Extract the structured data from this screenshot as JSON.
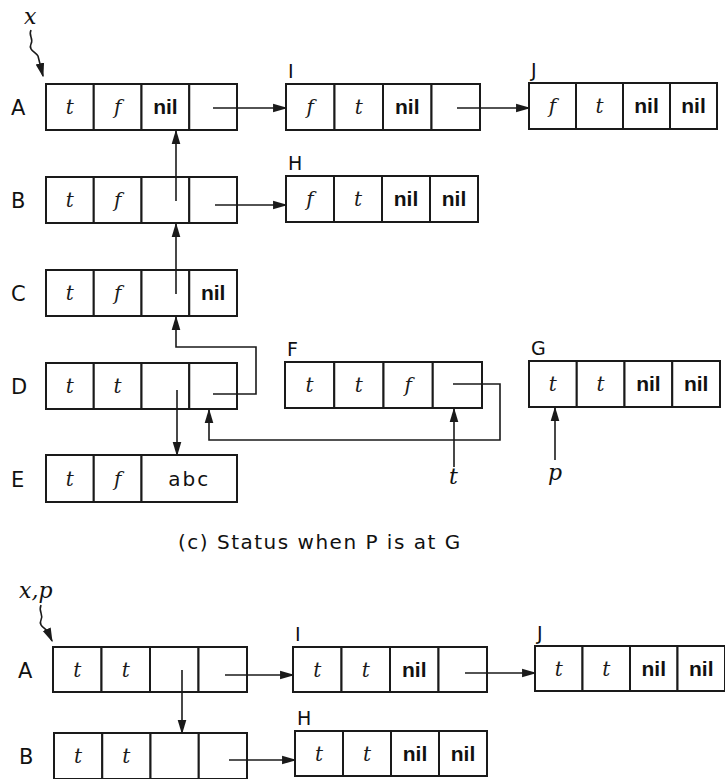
{
  "caption": "(c)  Status when P is at G",
  "colors": {
    "ink": "#1a1a1a",
    "background": "#ffffff"
  },
  "panels": [
    {
      "id": "top",
      "pointers": [
        {
          "label": "x",
          "target": "A"
        },
        {
          "label": "t",
          "target": "F"
        },
        {
          "label": "p",
          "target": "G"
        }
      ],
      "nodes": [
        {
          "name": "A",
          "label_side": "left",
          "x": 46,
          "y": 84,
          "w": 191,
          "h": 46,
          "cells": [
            {
              "v": "t",
              "k": "t"
            },
            {
              "v": "f",
              "k": "t"
            },
            {
              "v": "nil",
              "k": "nil"
            },
            {
              "v": "",
              "k": "ptr"
            }
          ]
        },
        {
          "name": "B",
          "label_side": "left",
          "x": 46,
          "y": 177,
          "w": 191,
          "h": 46,
          "cells": [
            {
              "v": "t",
              "k": "t"
            },
            {
              "v": "f",
              "k": "t"
            },
            {
              "v": "",
              "k": "ptr"
            },
            {
              "v": "",
              "k": "ptr"
            }
          ]
        },
        {
          "name": "C",
          "label_side": "left",
          "x": 46,
          "y": 270,
          "w": 191,
          "h": 46,
          "cells": [
            {
              "v": "t",
              "k": "t"
            },
            {
              "v": "f",
              "k": "t"
            },
            {
              "v": "",
              "k": "ptr"
            },
            {
              "v": "nil",
              "k": "nil"
            }
          ]
        },
        {
          "name": "D",
          "label_side": "left",
          "x": 46,
          "y": 363,
          "w": 191,
          "h": 46,
          "cells": [
            {
              "v": "t",
              "k": "t"
            },
            {
              "v": "t",
              "k": "t"
            },
            {
              "v": "",
              "k": "ptr"
            },
            {
              "v": "",
              "k": "ptr"
            }
          ]
        },
        {
          "name": "E",
          "label_side": "left",
          "x": 46,
          "y": 455,
          "w": 191,
          "h": 47,
          "cells": [
            {
              "v": "t",
              "k": "t"
            },
            {
              "v": "f",
              "k": "t"
            },
            {
              "v": "abc",
              "k": "str",
              "span": 2
            }
          ]
        },
        {
          "name": "I",
          "label_side": "top",
          "x": 286,
          "y": 84,
          "w": 194,
          "h": 46,
          "cells": [
            {
              "v": "f",
              "k": "t"
            },
            {
              "v": "t",
              "k": "t"
            },
            {
              "v": "nil",
              "k": "nil"
            },
            {
              "v": "",
              "k": "ptr"
            }
          ]
        },
        {
          "name": "J",
          "label_side": "top",
          "x": 529,
          "y": 83,
          "w": 188,
          "h": 46,
          "cells": [
            {
              "v": "f",
              "k": "t"
            },
            {
              "v": "t",
              "k": "t"
            },
            {
              "v": "nil",
              "k": "nil"
            },
            {
              "v": "nil",
              "k": "nil"
            }
          ]
        },
        {
          "name": "H",
          "label_side": "top",
          "x": 286,
          "y": 176,
          "w": 192,
          "h": 46,
          "cells": [
            {
              "v": "f",
              "k": "t"
            },
            {
              "v": "t",
              "k": "t"
            },
            {
              "v": "nil",
              "k": "nil"
            },
            {
              "v": "nil",
              "k": "nil"
            }
          ]
        },
        {
          "name": "F",
          "label_side": "top",
          "x": 285,
          "y": 362,
          "w": 197,
          "h": 46,
          "cells": [
            {
              "v": "t",
              "k": "t"
            },
            {
              "v": "t",
              "k": "t"
            },
            {
              "v": "f",
              "k": "t"
            },
            {
              "v": "",
              "k": "ptr"
            }
          ]
        },
        {
          "name": "G",
          "label_side": "top",
          "x": 529,
          "y": 361,
          "w": 191,
          "h": 46,
          "cells": [
            {
              "v": "t",
              "k": "t"
            },
            {
              "v": "t",
              "k": "t"
            },
            {
              "v": "nil",
              "k": "nil"
            },
            {
              "v": "nil",
              "k": "nil"
            }
          ]
        }
      ]
    },
    {
      "id": "bottom",
      "pointers": [
        {
          "label": "x,p",
          "target": "A"
        }
      ],
      "nodes": [
        {
          "name": "A",
          "label_side": "left",
          "x": 53,
          "y": 647,
          "w": 194,
          "h": 45,
          "cells": [
            {
              "v": "t",
              "k": "t"
            },
            {
              "v": "t",
              "k": "t"
            },
            {
              "v": "",
              "k": "ptr"
            },
            {
              "v": "",
              "k": "ptr"
            }
          ]
        },
        {
          "name": "I",
          "label_side": "top",
          "x": 293,
          "y": 647,
          "w": 194,
          "h": 45,
          "cells": [
            {
              "v": "t",
              "k": "t"
            },
            {
              "v": "t",
              "k": "t"
            },
            {
              "v": "nil",
              "k": "nil"
            },
            {
              "v": "",
              "k": "ptr"
            }
          ]
        },
        {
          "name": "J",
          "label_side": "top",
          "x": 535,
          "y": 646,
          "w": 190,
          "h": 45,
          "cells": [
            {
              "v": "t",
              "k": "t"
            },
            {
              "v": "t",
              "k": "t"
            },
            {
              "v": "nil",
              "k": "nil"
            },
            {
              "v": "nil",
              "k": "nil"
            }
          ]
        },
        {
          "name": "B",
          "label_side": "left",
          "x": 54,
          "y": 733,
          "w": 193,
          "h": 46,
          "cells": [
            {
              "v": "t",
              "k": "t"
            },
            {
              "v": "t",
              "k": "t"
            },
            {
              "v": "",
              "k": "ptr"
            },
            {
              "v": "",
              "k": "ptr"
            }
          ]
        },
        {
          "name": "H",
          "label_side": "top",
          "x": 295,
          "y": 731,
          "w": 192,
          "h": 45,
          "cells": [
            {
              "v": "t",
              "k": "t"
            },
            {
              "v": "t",
              "k": "t"
            },
            {
              "v": "nil",
              "k": "nil"
            },
            {
              "v": "nil",
              "k": "nil"
            }
          ]
        }
      ]
    }
  ],
  "arrows": [
    {
      "from": "top.A.rlink",
      "to": "top.I",
      "path": [
        [
          213,
          108
        ],
        [
          286,
          108
        ]
      ],
      "head": "right"
    },
    {
      "from": "top.I.rlink",
      "to": "top.J",
      "path": [
        [
          457,
          108
        ],
        [
          529,
          108
        ]
      ],
      "head": "right"
    },
    {
      "from": "top.B.rlink",
      "to": "top.H",
      "path": [
        [
          215,
          205
        ],
        [
          286,
          205
        ]
      ],
      "head": "right"
    },
    {
      "from": "top.B.llink",
      "to": "top.A",
      "path": [
        [
          176,
          201
        ],
        [
          176,
          131
        ]
      ],
      "head": "up"
    },
    {
      "from": "top.C.llink",
      "to": "top.B",
      "path": [
        [
          176,
          294
        ],
        [
          176,
          224
        ]
      ],
      "head": "up"
    },
    {
      "from": "top.D.rlink",
      "to": "top.C",
      "path": [
        [
          213,
          394
        ],
        [
          256,
          394
        ],
        [
          256,
          347
        ],
        [
          176,
          347
        ],
        [
          176,
          317
        ]
      ],
      "head": "up"
    },
    {
      "from": "top.D.llink",
      "to": "top.E",
      "path": [
        [
          177,
          390
        ],
        [
          177,
          455
        ]
      ],
      "head": "down"
    },
    {
      "from": "top.F.rlink",
      "to": "top.D",
      "path": [
        [
          453,
          384
        ],
        [
          500,
          384
        ],
        [
          500,
          440
        ],
        [
          209,
          440
        ],
        [
          209,
          410
        ]
      ],
      "head": "up"
    },
    {
      "from": "ptr.t",
      "to": "top.F",
      "path": [
        [
          454,
          467
        ],
        [
          454,
          409
        ]
      ],
      "head": "up"
    },
    {
      "from": "ptr.p",
      "to": "top.G",
      "path": [
        [
          555,
          460
        ],
        [
          555,
          408
        ]
      ],
      "head": "up"
    },
    {
      "from": "bottom.A.rlink",
      "to": "bottom.I",
      "path": [
        [
          225,
          675
        ],
        [
          293,
          675
        ]
      ],
      "head": "right"
    },
    {
      "from": "bottom.I.rlink",
      "to": "bottom.J",
      "path": [
        [
          465,
          673
        ],
        [
          535,
          673
        ]
      ],
      "head": "right"
    },
    {
      "from": "bottom.A.llink",
      "to": "bottom.B",
      "path": [
        [
          182,
          670
        ],
        [
          182,
          733
        ]
      ],
      "head": "down"
    },
    {
      "from": "bottom.B.rlink",
      "to": "bottom.H",
      "path": [
        [
          229,
          760
        ],
        [
          295,
          760
        ]
      ],
      "head": "right"
    }
  ],
  "labels_pos": {
    "top_x_ptr": {
      "text": "x",
      "x": 24,
      "y": 24
    },
    "top_t_ptr": {
      "text": "t",
      "x": 449,
      "y": 484
    },
    "top_p_ptr": {
      "text": "p",
      "x": 548,
      "y": 480
    },
    "bottom_xp_ptr": {
      "text": "x,p",
      "x": 19,
      "y": 598
    },
    "caption_pos": {
      "x": 178,
      "y": 549
    }
  }
}
